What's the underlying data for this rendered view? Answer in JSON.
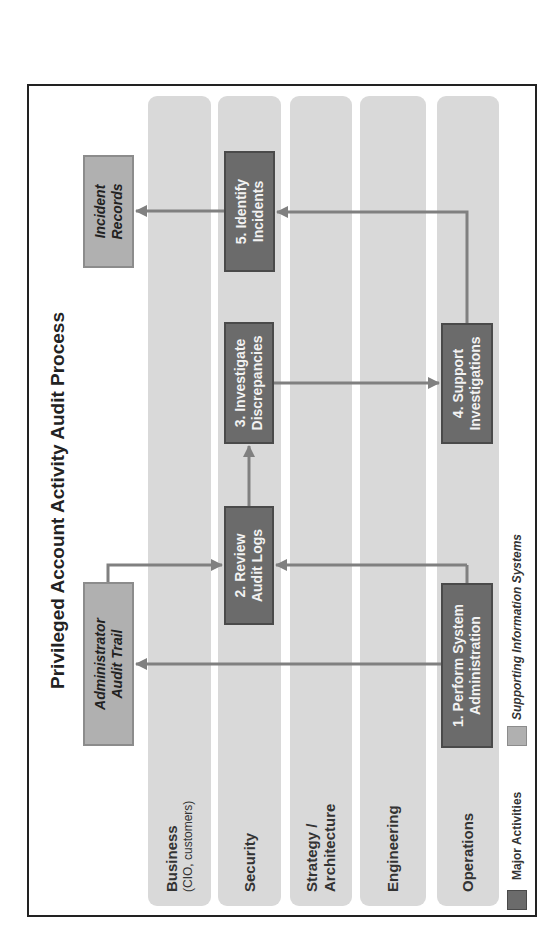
{
  "title": "Privileged Account Activity Audit Process",
  "lanes": [
    {
      "label": "Business",
      "sublabel": "(CIO, customers)"
    },
    {
      "label": "Security",
      "sublabel": ""
    },
    {
      "label": "Strategy /",
      "sublabel_bold": "Architecture"
    },
    {
      "label": "Engineering",
      "sublabel": ""
    },
    {
      "label": "Operations",
      "sublabel": ""
    }
  ],
  "major_activities": [
    {
      "id": 1,
      "line1": "1. Perform System",
      "line2": "Administration",
      "lane": "Operations"
    },
    {
      "id": 2,
      "line1": "2. Review",
      "line2": "Audit Logs",
      "lane": "Security"
    },
    {
      "id": 3,
      "line1": "3. Investigate",
      "line2": "Discrepancies",
      "lane": "Security"
    },
    {
      "id": 4,
      "line1": "4. Support",
      "line2": "Investigations",
      "lane": "Operations"
    },
    {
      "id": 5,
      "line1": "5. Identify",
      "line2": "Incidents",
      "lane": "Security"
    }
  ],
  "supporting_systems": [
    {
      "line1": "Administrator",
      "line2": "Audit Trail"
    },
    {
      "line1": "Incident",
      "line2": "Records"
    }
  ],
  "flows": [
    {
      "from": "1. Perform System Administration",
      "to": "Administrator Audit Trail"
    },
    {
      "from": "1. Perform System Administration",
      "to": "2. Review Audit Logs"
    },
    {
      "from": "Administrator Audit Trail",
      "to": "2. Review Audit Logs"
    },
    {
      "from": "2. Review Audit Logs",
      "to": "3. Investigate Discrepancies"
    },
    {
      "from": "3. Investigate Discrepancies",
      "to": "4. Support Investigations"
    },
    {
      "from": "4. Support Investigations",
      "to": "5. Identify Incidents"
    },
    {
      "from": "5. Identify Incidents",
      "to": "Incident Records"
    }
  ],
  "legend": {
    "major": "Major Activities",
    "supporting": "Supporting Information Systems"
  },
  "colors": {
    "major_fill": "#6b6b6b",
    "supporting_fill": "#b0b0b0",
    "lane_fill": "#d9d9d9",
    "arrow": "#808080"
  }
}
